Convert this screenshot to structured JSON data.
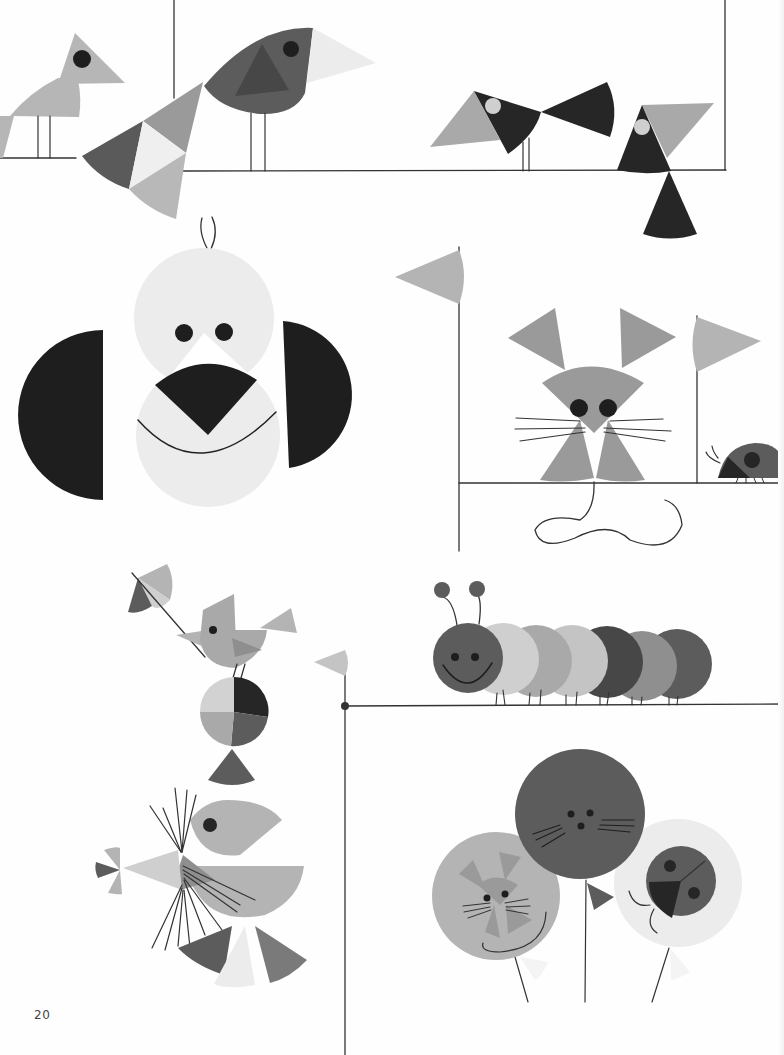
{
  "page": {
    "number": "20"
  },
  "illustrations": [
    {
      "name": "birds-on-perch",
      "label": "Birds"
    },
    {
      "name": "puppy-face",
      "label": "Puppy"
    },
    {
      "name": "mouse-with-flags",
      "label": "Mouse"
    },
    {
      "name": "ladybug",
      "label": "Ladybug"
    },
    {
      "name": "seal-balancing-ball",
      "label": "Seal"
    },
    {
      "name": "caterpillar",
      "label": "Caterpillar"
    },
    {
      "name": "animal-balloons",
      "label": "Balloons"
    }
  ],
  "colors": {
    "black": "#1e1e1e",
    "dark": "#474747",
    "mid_dark": "#5e5e5e",
    "mid": "#8f8f8f",
    "light": "#b4b4b4",
    "pale": "#d2d2d2",
    "very_pale": "#ececec",
    "line": "#333333"
  }
}
